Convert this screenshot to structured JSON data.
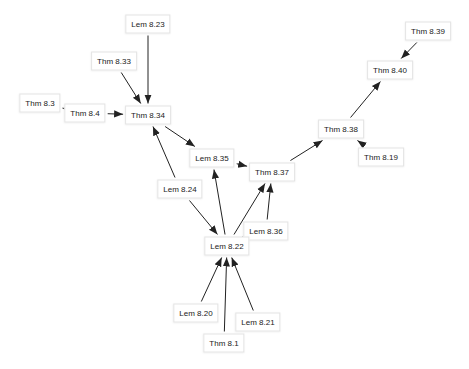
{
  "graph": {
    "edge_color": "#222222",
    "node_border_color": "#e4e4e4",
    "nodes": [
      {
        "id": "lem823",
        "label": "Lem 8.23",
        "x": 148,
        "y": 24
      },
      {
        "id": "thm833",
        "label": "Thm 8.33",
        "x": 114,
        "y": 61
      },
      {
        "id": "thm83",
        "label": "Thm 8.3",
        "x": 40,
        "y": 103
      },
      {
        "id": "thm84",
        "label": "Thm 8.4",
        "x": 85,
        "y": 113
      },
      {
        "id": "thm834",
        "label": "Thm 8.34",
        "x": 148,
        "y": 115
      },
      {
        "id": "lem835",
        "label": "Lem 8.35",
        "x": 212,
        "y": 158
      },
      {
        "id": "lem824",
        "label": "Lem 8.24",
        "x": 180,
        "y": 189
      },
      {
        "id": "thm837",
        "label": "Thm 8.37",
        "x": 272,
        "y": 172
      },
      {
        "id": "thm838",
        "label": "Thm 8.38",
        "x": 341,
        "y": 129
      },
      {
        "id": "thm819",
        "label": "Thm 8.19",
        "x": 381,
        "y": 157
      },
      {
        "id": "thm840",
        "label": "Thm 8.40",
        "x": 390,
        "y": 70
      },
      {
        "id": "thm839",
        "label": "Thm 8.39",
        "x": 428,
        "y": 31
      },
      {
        "id": "lem836",
        "label": "Lem 8.36",
        "x": 266,
        "y": 231
      },
      {
        "id": "lem822",
        "label": "Lem 8.22",
        "x": 227,
        "y": 246
      },
      {
        "id": "lem820",
        "label": "Lem 8.20",
        "x": 196,
        "y": 313
      },
      {
        "id": "lem821",
        "label": "Lem 8.21",
        "x": 258,
        "y": 322
      },
      {
        "id": "thm81",
        "label": "Thm 8.1",
        "x": 224,
        "y": 343
      }
    ],
    "edges": [
      {
        "from": "lem823",
        "to": "thm834"
      },
      {
        "from": "thm833",
        "to": "thm834"
      },
      {
        "from": "thm83",
        "to": "thm84"
      },
      {
        "from": "thm84",
        "to": "thm834"
      },
      {
        "from": "thm834",
        "to": "lem835"
      },
      {
        "from": "lem835",
        "to": "thm837"
      },
      {
        "from": "lem824",
        "to": "thm834"
      },
      {
        "from": "lem824",
        "to": "lem822"
      },
      {
        "from": "lem822",
        "to": "lem835"
      },
      {
        "from": "lem822",
        "to": "thm837"
      },
      {
        "from": "lem836",
        "to": "thm837"
      },
      {
        "from": "lem836",
        "to": "lem822"
      },
      {
        "from": "thm837",
        "to": "thm838"
      },
      {
        "from": "thm819",
        "to": "thm838"
      },
      {
        "from": "thm838",
        "to": "thm840"
      },
      {
        "from": "thm839",
        "to": "thm840"
      },
      {
        "from": "lem820",
        "to": "lem822"
      },
      {
        "from": "thm81",
        "to": "lem822"
      },
      {
        "from": "lem821",
        "to": "lem822"
      }
    ]
  }
}
